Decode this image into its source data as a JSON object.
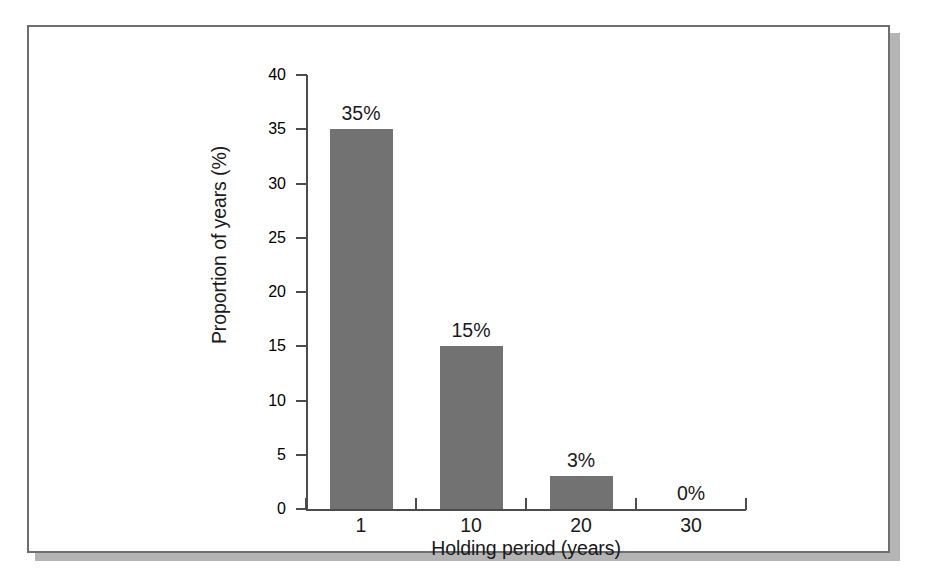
{
  "chart_data": {
    "type": "bar",
    "title": "",
    "subtitle": "",
    "xlabel": "Holding period (years)",
    "ylabel": "Proportion of years (%)",
    "categories": [
      "1",
      "10",
      "20",
      "30"
    ],
    "values": [
      35,
      15,
      3,
      0
    ],
    "data_labels": [
      "35%",
      "15%",
      "3%",
      "0%"
    ],
    "ylim": [
      0,
      40
    ],
    "yticks": [
      0,
      5,
      10,
      15,
      20,
      25,
      30,
      35,
      40
    ],
    "ytick_labels": [
      "0",
      "5",
      "10",
      "15",
      "20",
      "25",
      "30",
      "35",
      "40"
    ],
    "grid": false,
    "legend": null,
    "legend_position": "none",
    "bar_color": "#727272",
    "axis_color": "#4c4c4c",
    "text_color": "#1a1a1a",
    "background": "#ffffff"
  },
  "figure": {
    "frame_color": "#6e6e73",
    "shadow_color": "#b4b4b4"
  }
}
